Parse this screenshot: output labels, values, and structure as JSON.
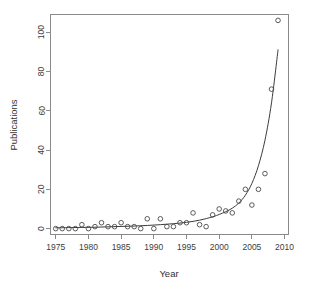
{
  "chart_data": {
    "type": "scatter",
    "title": "",
    "xlabel": "Year",
    "ylabel": "Publications",
    "xlim": [
      1974.2,
      2010.6
    ],
    "ylim": [
      -3,
      109
    ],
    "grid": false,
    "legend": "none",
    "xticks": [
      1975,
      1980,
      1985,
      1990,
      1995,
      2000,
      2005,
      2010
    ],
    "xtick_labels": [
      "1975",
      "1980",
      "1985",
      "1990",
      "1995",
      "2000",
      "2005",
      "2010"
    ],
    "yticks": [
      0,
      20,
      40,
      60,
      80,
      100
    ],
    "ytick_labels": [
      "0",
      "20",
      "40",
      "60",
      "80",
      "100"
    ],
    "marker": "open-circle",
    "series": [
      {
        "name": "Publications per year",
        "x": [
          1975,
          1976,
          1977,
          1978,
          1979,
          1980,
          1981,
          1982,
          1983,
          1984,
          1985,
          1986,
          1987,
          1988,
          1989,
          1990,
          1991,
          1992,
          1993,
          1994,
          1995,
          1996,
          1997,
          1998,
          1999,
          2000,
          2001,
          2002,
          2003,
          2004,
          2005,
          2006,
          2007,
          2008,
          2009
        ],
        "y": [
          0,
          0,
          0,
          0,
          2,
          0,
          1,
          3,
          1,
          1,
          3,
          1,
          1,
          0,
          5,
          0,
          5,
          1,
          1,
          3,
          3,
          8,
          2,
          1,
          7,
          10,
          9,
          8,
          14,
          20,
          12,
          20,
          28,
          71,
          106
        ]
      }
    ],
    "fit": {
      "name": "exponential-trend",
      "type": "line",
      "x": [
        1975,
        1977,
        1979,
        1981,
        1983,
        1985,
        1987,
        1989,
        1991,
        1993,
        1995,
        1997,
        1999,
        2000,
        2001,
        2002,
        2003,
        2004,
        2005,
        2006,
        2007,
        2008,
        2009
      ],
      "y": [
        0.4,
        0.5,
        0.6,
        0.7,
        0.9,
        1.1,
        1.3,
        1.6,
        2.0,
        2.5,
        3.2,
        4.3,
        6.0,
        7.2,
        8.6,
        10.4,
        13.0,
        17.0,
        23.0,
        32.0,
        45.0,
        64.0,
        91.0
      ]
    }
  },
  "figure": {
    "axis_color": "#8a8a8a",
    "marker_color": "#4a4a4a",
    "curve_color": "#3c3c3c",
    "background": "#ffffff"
  }
}
